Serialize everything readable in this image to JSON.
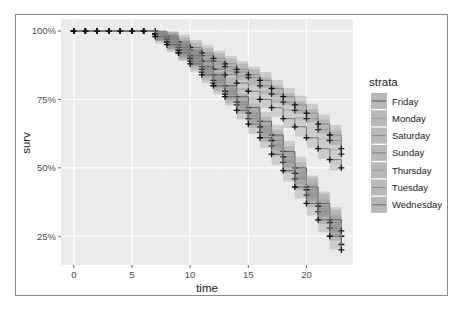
{
  "chart_data": {
    "type": "line",
    "subtype": "kaplan-meier step curves with confidence bands and censor marks",
    "title": "",
    "xlabel": "time",
    "ylabel": "surv",
    "x_ticks": [
      0,
      5,
      10,
      15,
      20
    ],
    "x_tick_labels": [
      "0",
      "5",
      "10",
      "15",
      "20"
    ],
    "y_ticks": [
      1.0,
      0.75,
      0.5,
      0.25
    ],
    "y_tick_labels": [
      "100%",
      "75%",
      "50%",
      "25%"
    ],
    "xlim": [
      -1.1,
      24.0
    ],
    "ylim": [
      0.145,
      1.044
    ],
    "grid": true,
    "legend_position": "right",
    "legend_title": "strata",
    "x": [
      0,
      1,
      2,
      3,
      4,
      5,
      6,
      7,
      8,
      9,
      10,
      11,
      12,
      13,
      14,
      15,
      16,
      17,
      18,
      19,
      20,
      21,
      22,
      23
    ],
    "series": [
      {
        "name": "Friday",
        "values": [
          1,
          1,
          1,
          1,
          1,
          1,
          1,
          0.99,
          0.96,
          0.93,
          0.9,
          0.87,
          0.84,
          0.8,
          0.76,
          0.72,
          0.67,
          0.62,
          0.56,
          0.5,
          0.43,
          0.37,
          0.31,
          0.25
        ]
      },
      {
        "name": "Monday",
        "values": [
          1,
          1,
          1,
          1,
          1,
          1,
          1,
          0.99,
          0.97,
          0.95,
          0.93,
          0.91,
          0.89,
          0.87,
          0.85,
          0.83,
          0.8,
          0.77,
          0.74,
          0.71,
          0.68,
          0.64,
          0.6,
          0.55
        ]
      },
      {
        "name": "Saturday",
        "values": [
          1,
          1,
          1,
          1,
          1,
          1,
          1,
          1.0,
          0.98,
          0.96,
          0.94,
          0.92,
          0.9,
          0.88,
          0.86,
          0.84,
          0.82,
          0.79,
          0.76,
          0.73,
          0.7,
          0.66,
          0.62,
          0.57
        ]
      },
      {
        "name": "Sunday",
        "values": [
          1,
          1,
          1,
          1,
          1,
          1,
          1,
          0.99,
          0.97,
          0.94,
          0.91,
          0.89,
          0.86,
          0.84,
          0.81,
          0.78,
          0.75,
          0.72,
          0.68,
          0.65,
          0.61,
          0.57,
          0.53,
          0.5
        ]
      },
      {
        "name": "Thursday",
        "values": [
          1,
          1,
          1,
          1,
          1,
          1,
          1,
          0.99,
          0.96,
          0.92,
          0.89,
          0.85,
          0.81,
          0.77,
          0.73,
          0.68,
          0.63,
          0.58,
          0.52,
          0.46,
          0.4,
          0.34,
          0.28,
          0.22
        ]
      },
      {
        "name": "Tuesday",
        "values": [
          1,
          1,
          1,
          1,
          1,
          1,
          1,
          0.99,
          0.96,
          0.93,
          0.9,
          0.86,
          0.82,
          0.78,
          0.74,
          0.7,
          0.65,
          0.6,
          0.54,
          0.48,
          0.42,
          0.36,
          0.3,
          0.27
        ]
      },
      {
        "name": "Wednesday",
        "values": [
          1,
          1,
          1,
          1,
          1,
          1,
          1,
          0.98,
          0.95,
          0.92,
          0.88,
          0.84,
          0.8,
          0.76,
          0.71,
          0.66,
          0.61,
          0.55,
          0.49,
          0.43,
          0.37,
          0.31,
          0.25,
          0.2
        ]
      }
    ],
    "band_halfwidth": 0.025
  },
  "legend": {
    "title": "strata",
    "items": [
      "Friday",
      "Monday",
      "Saturday",
      "Sunday",
      "Thursday",
      "Tuesday",
      "Wednesday"
    ]
  },
  "colors": {
    "panel_bg": "#ebebeb",
    "grid_major": "#ffffff",
    "grid_minor": "#f4f4f4",
    "strata": [
      "#555555",
      "#9a9a9a",
      "#8c8c8c",
      "#7a7a7a",
      "#9e9e9e",
      "#8e8e8e",
      "#6a6a6a"
    ],
    "band": "#7f7f7f",
    "censor": "#111111"
  }
}
